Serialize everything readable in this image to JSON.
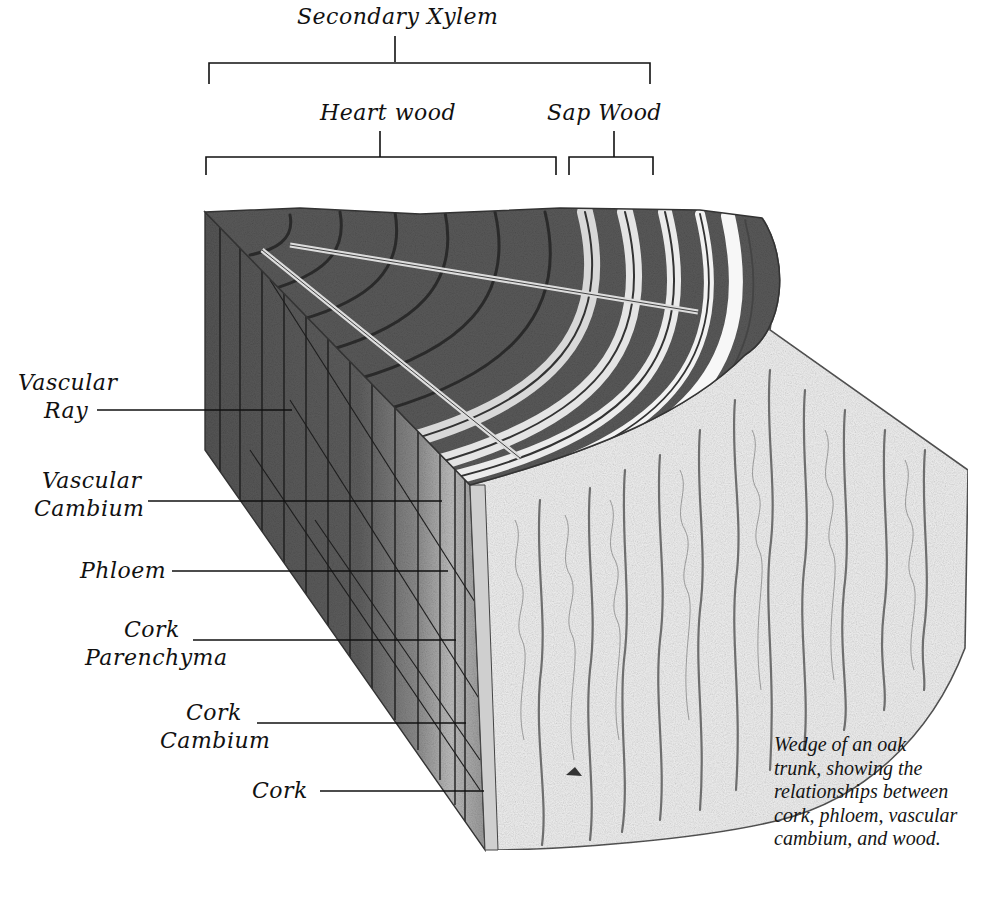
{
  "diagram": {
    "subject": "Wedge of an oak trunk",
    "brackets": {
      "secondary_xylem": {
        "label": "Secondary Xylem"
      },
      "heart_wood": {
        "label": "Heart wood"
      },
      "sap_wood": {
        "label": "Sap Wood"
      }
    },
    "side_labels": [
      {
        "id": "vascular-ray",
        "lines": [
          "Vascular",
          "Ray"
        ]
      },
      {
        "id": "vascular-cambium",
        "lines": [
          "Vascular",
          "Cambium"
        ]
      },
      {
        "id": "phloem",
        "lines": [
          "Phloem"
        ]
      },
      {
        "id": "cork-parenchyma",
        "lines": [
          "Cork",
          "Parenchyma"
        ]
      },
      {
        "id": "cork-cambium",
        "lines": [
          "Cork",
          "Cambium"
        ]
      },
      {
        "id": "cork",
        "lines": [
          "Cork"
        ]
      }
    ],
    "caption": {
      "lines": [
        "Wedge of an oak",
        "trunk, showing the",
        "relationships between",
        "cork, phloem, vascular",
        "cambium, and wood."
      ]
    },
    "colors": {
      "ink": "#111111",
      "heartwood_dark": "#4a4a4a",
      "heartwood_mid": "#6b6b6b",
      "sapwood_light": "#e6e6e6",
      "bark_light": "#eeeeee",
      "bark_line": "#7a7a7a",
      "background": "#ffffff"
    }
  }
}
